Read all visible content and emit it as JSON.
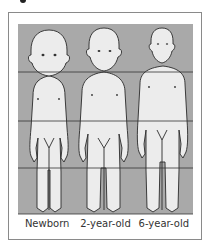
{
  "figure": {
    "colors": {
      "band": "#a9a9a9",
      "skin": "#ececec",
      "outline": "#2a2a2a",
      "line": "#333333"
    },
    "labels": [
      "Newborn",
      "2-year-old",
      "6-year-old"
    ]
  }
}
